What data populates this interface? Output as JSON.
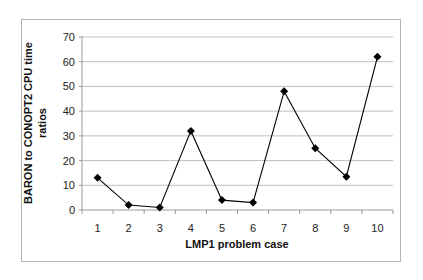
{
  "chart_data": {
    "type": "line",
    "title": "",
    "xlabel": "LMP1 problem case",
    "ylabel_lines": [
      "BARON to CONOPT2 CPU time",
      "ratios"
    ],
    "ylabel": "BARON to CONOPT2 CPU time ratios",
    "categories": [
      "1",
      "2",
      "3",
      "4",
      "5",
      "6",
      "7",
      "8",
      "9",
      "10"
    ],
    "series": [
      {
        "name": "CPU time ratio",
        "marker": "diamond",
        "color": "#000000",
        "values": [
          13,
          2,
          1,
          32,
          4,
          3,
          48,
          25,
          13.5,
          62
        ]
      }
    ],
    "ylim": [
      0,
      70
    ],
    "yticks": [
      0,
      10,
      20,
      30,
      40,
      50,
      60,
      70
    ],
    "grid": true,
    "legend": "none"
  },
  "colors": {
    "line": "#000000",
    "grid": "#c0c0c0",
    "axis": "#999999",
    "frame": "#b4b4b4"
  }
}
